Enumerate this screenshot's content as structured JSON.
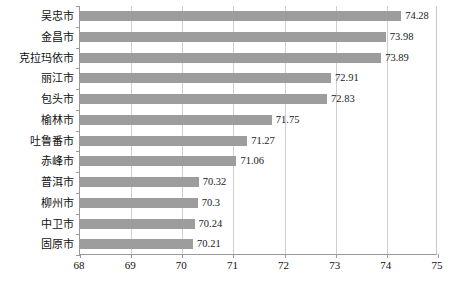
{
  "chart_data": {
    "type": "bar",
    "orientation": "horizontal",
    "title": "",
    "subtitle": "",
    "xlabel": "",
    "ylabel": "",
    "xlim": [
      68,
      75
    ],
    "xticks": [
      "68",
      "69",
      "70",
      "71",
      "72",
      "73",
      "74",
      "75"
    ],
    "grid": "vertical",
    "legend": "none",
    "bar_color": "#9d9d9d",
    "plot_background": "#ffffff",
    "gridline_color": "#cfcfcf",
    "axis_color": "#9a9a9a",
    "categories": [
      "吴忠市",
      "金昌市",
      "克拉玛依市",
      "丽江市",
      "包头市",
      "榆林市",
      "吐鲁番市",
      "赤峰市",
      "普洱市",
      "柳州市",
      "中卫市",
      "固原市"
    ],
    "values": [
      74.28,
      73.98,
      73.89,
      72.91,
      72.83,
      71.75,
      71.27,
      71.06,
      70.32,
      70.3,
      70.24,
      70.21
    ],
    "data_labels": [
      "74.28",
      "73.98",
      "73.89",
      "72.91",
      "72.83",
      "71.75",
      "71.27",
      "71.06",
      "70.32",
      "70.3",
      "70.24",
      "70.21"
    ]
  }
}
